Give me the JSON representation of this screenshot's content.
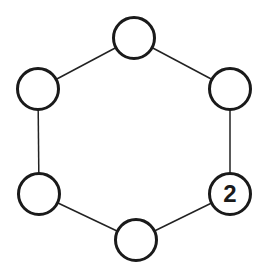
{
  "diagram": {
    "type": "hexagon-ring",
    "nodes": [
      {
        "id": "top",
        "cx": 134,
        "cy": 38,
        "label": ""
      },
      {
        "id": "upper-right",
        "cx": 230,
        "cy": 89,
        "label": ""
      },
      {
        "id": "lower-right",
        "cx": 230,
        "cy": 194,
        "label": "2"
      },
      {
        "id": "bottom",
        "cx": 136,
        "cy": 240,
        "label": ""
      },
      {
        "id": "lower-left",
        "cx": 39,
        "cy": 194,
        "label": ""
      },
      {
        "id": "upper-left",
        "cx": 38,
        "cy": 89,
        "label": ""
      }
    ],
    "edges": [
      [
        "top",
        "upper-right"
      ],
      [
        "upper-right",
        "lower-right"
      ],
      [
        "lower-right",
        "bottom"
      ],
      [
        "bottom",
        "lower-left"
      ],
      [
        "lower-left",
        "upper-left"
      ],
      [
        "upper-left",
        "top"
      ]
    ],
    "colors": {
      "stroke": "#1a1a1a",
      "fill": "#ffffff"
    }
  }
}
